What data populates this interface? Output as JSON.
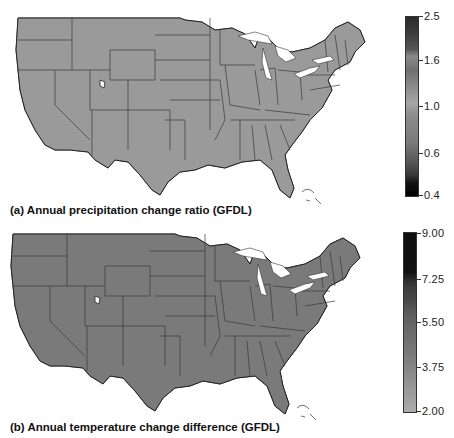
{
  "panels": [
    {
      "id": "a",
      "caption": "(a) Annual precipitation change ratio (GFDL)",
      "colorbar": {
        "ticks": [
          "2.5",
          "1.6",
          "1.0",
          "0.6",
          "0.4"
        ],
        "min": 0.4,
        "max": 2.5,
        "gradient": [
          "#2a2a2a",
          "#3a3a3a",
          "#555555",
          "#8a8a8a",
          "#6f6f6f",
          "#a5a5a5",
          "#8c8c8c",
          "#7a7a7a",
          "#5a5a5a",
          "#3a3a3a",
          "#111111",
          "#000000"
        ]
      },
      "regions": {
        "northwest": "#a9a9a9",
        "southwest_desert": "#8a8a8a",
        "great_plains": "#8e8e8e",
        "midwest": "#999999",
        "southeast": "#8f8f8f",
        "northeast": "#7a7a7a",
        "florida": "#7b7b7b"
      }
    },
    {
      "id": "b",
      "caption": "(b) Annual temperature change difference (GFDL)",
      "colorbar": {
        "ticks": [
          "9.00",
          "7.25",
          "5.50",
          "3.75",
          "2.00"
        ],
        "min": 2.0,
        "max": 9.0,
        "gradient": [
          "#0f0f0f",
          "#111111",
          "#161616",
          "#3a3a3a",
          "#4a4a4a",
          "#5a5a5a",
          "#6a6a6a",
          "#7a7a7a",
          "#8a8a8a",
          "#9a9a9a",
          "#aaaaaa"
        ]
      },
      "regions": {
        "west": "#a6a6a6",
        "mountain": "#9c9c9c",
        "great_plains": "#8a8a8a",
        "midwest": "#757575",
        "south": "#7c7c7c",
        "east": "#717171",
        "northeast": "#6e6e6e"
      }
    }
  ]
}
